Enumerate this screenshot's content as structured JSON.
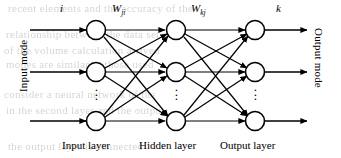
{
  "figure": {
    "type": "neural-network-diagram",
    "side_labels": {
      "left": "Input mode",
      "right": "Output mode"
    },
    "index_labels": {
      "input_index": "i",
      "output_index": "k"
    },
    "weight_labels": [
      {
        "symbol": "W",
        "subscript": "ji"
      },
      {
        "symbol": "W",
        "subscript": "kj"
      }
    ],
    "layers": [
      {
        "id": "input",
        "caption": "Input layer",
        "nodes_shown": 3,
        "has_ellipsis": true
      },
      {
        "id": "hidden",
        "caption": "Hidden layer",
        "nodes_shown": 3,
        "has_ellipsis": true
      },
      {
        "id": "output",
        "caption": "Output layer",
        "nodes_shown": 3,
        "has_ellipsis": true
      }
    ],
    "ellipsis_glyph": "⋮",
    "connectivity": "fully-connected",
    "colors": {
      "stroke": "#000000",
      "node_fill": "#ffffff",
      "background": "#ffffff",
      "bleed_text": "#b9b3ad"
    }
  },
  "background_bleed": {
    "lines": [
      {
        "text": "recent elements and the accuracy of the",
        "x": 8,
        "y": 2
      },
      {
        "text": "relationship between the data set as",
        "x": 6,
        "y": 28
      },
      {
        "text": "of the volume  calculation arrived",
        "x": 4,
        "y": 44
      },
      {
        "text": "modes are similar to those used",
        "x": 6,
        "y": 58
      },
      {
        "text": "consider a neural network of the",
        "x": 4,
        "y": 88
      },
      {
        "text": "in the second layer and the output",
        "x": 6,
        "y": 104
      },
      {
        "text": "the output layer is connected",
        "x": 8,
        "y": 140
      }
    ]
  }
}
